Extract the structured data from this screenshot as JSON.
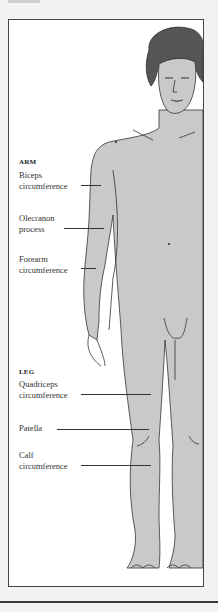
{
  "diagram": {
    "colors": {
      "skin": "#c9c9c9",
      "hair": "#555555",
      "outline": "#333333",
      "frame_border": "#444444",
      "background": "#f2f2f2",
      "panel": "#ffffff"
    },
    "sections": [
      {
        "title": "ARM",
        "labels": [
          {
            "line1": "Biceps",
            "line2": "circumference"
          },
          {
            "line1": "Olecranon",
            "line2": "process"
          },
          {
            "line1": "Forearm",
            "line2": "circumference"
          }
        ]
      },
      {
        "title": "LEG",
        "labels": [
          {
            "line1": "Quadriceps",
            "line2": "circumference"
          },
          {
            "line1": "Patella",
            "line2": ""
          },
          {
            "line1": "Calf",
            "line2": "circumference"
          }
        ]
      }
    ]
  }
}
